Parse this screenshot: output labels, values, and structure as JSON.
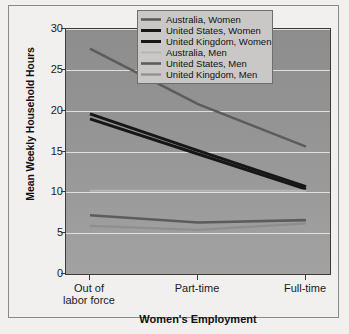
{
  "chart_data": {
    "type": "line",
    "title": "",
    "xlabel": "Women's Employment",
    "ylabel": "Mean Weekly Household Hours",
    "categories": [
      "Out of labor force",
      "Part-time",
      "Full-time"
    ],
    "ylim": [
      0,
      30
    ],
    "yticks": [
      0,
      5,
      10,
      15,
      20,
      25,
      30
    ],
    "grid": true,
    "legend_position": "top-right",
    "series": [
      {
        "name": "Australia, Women",
        "values": [
          27.6,
          20.8,
          15.6
        ],
        "color": "#5c5c5c",
        "width": 2.6
      },
      {
        "name": "United States, Women",
        "values": [
          19.6,
          15.1,
          10.7
        ],
        "color": "#161616",
        "width": 3.0
      },
      {
        "name": "United Kingdom, Women",
        "values": [
          19.0,
          14.7,
          10.4
        ],
        "color": "#161616",
        "width": 3.0
      },
      {
        "name": "Australia, Men",
        "values": [
          10.2,
          10.2,
          10.2
        ],
        "color": "#b4b4b4",
        "width": 2.0
      },
      {
        "name": "United States, Men",
        "values": [
          7.2,
          6.3,
          6.6
        ],
        "color": "#5c5c5c",
        "width": 2.6
      },
      {
        "name": "United Kingdom, Men",
        "values": [
          5.9,
          5.4,
          6.2
        ],
        "color": "#8e8e8e",
        "width": 2.2
      }
    ]
  },
  "axes": {
    "y_tick_labels": [
      "30",
      "25",
      "20",
      "15",
      "10",
      "5",
      "0"
    ],
    "x_tick_labels": [
      [
        "Out of",
        "labor force"
      ],
      [
        "Part-time"
      ],
      [
        "Full-time"
      ]
    ],
    "y_title": "Mean Weekly Household Hours",
    "x_title": "Women's Employment"
  },
  "legend": {
    "entries": [
      {
        "label": "Australia, Women"
      },
      {
        "label": "United States, Women"
      },
      {
        "label": "United Kingdom, Women"
      },
      {
        "label": "Australia, Men"
      },
      {
        "label": "United States, Men"
      },
      {
        "label": "United Kingdom, Men"
      }
    ]
  }
}
